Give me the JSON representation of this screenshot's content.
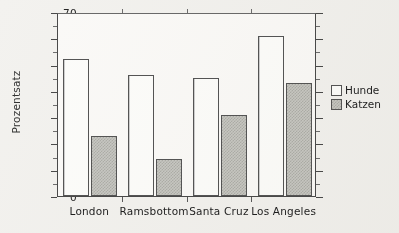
{
  "chart_data": {
    "type": "bar",
    "title": "",
    "xlabel": "",
    "ylabel": "Prozentsatz",
    "ylim": [
      0,
      70
    ],
    "ytick_step": 10,
    "yminor_step": 5,
    "grid": false,
    "legend_position": "right",
    "categories": [
      "London",
      "Ramsbottom",
      "Santa Cruz",
      "Los Angeles"
    ],
    "ytick_labels": [
      "0",
      "10",
      "20",
      "30",
      "40",
      "50",
      "60",
      "70"
    ],
    "series": [
      {
        "name": "Hunde",
        "values": [
          52,
          46,
          45,
          61
        ],
        "fill": "white",
        "edge": "#555555"
      },
      {
        "name": "Katzen",
        "values": [
          23,
          14,
          31,
          43
        ],
        "fill": "#c9c9c4",
        "edge": "#555555"
      }
    ]
  },
  "legend": {
    "items": [
      {
        "label": "Hunde",
        "style": "dogs"
      },
      {
        "label": "Katzen",
        "style": "cats"
      }
    ]
  },
  "colors": {
    "background": "#f3f2ef",
    "plot_background": "#fbfaf8",
    "axis": "#4a4a4a",
    "text": "#1e1e1e"
  }
}
